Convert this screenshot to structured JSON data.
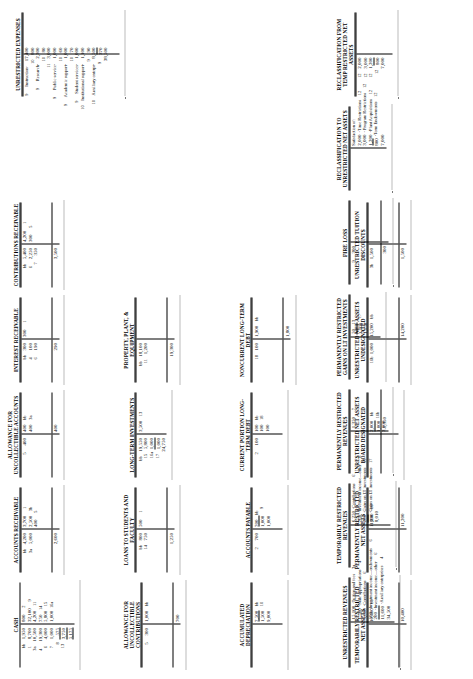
{
  "document": {
    "type": "t-account-worksheet",
    "orientation": "landscape-rotated"
  },
  "accounts": [
    {
      "id": "cash",
      "title": "CASH",
      "debits": [
        {
          "ref": "bb",
          "amount": "1,950"
        },
        {
          "ref": "1",
          "amount": "8,700"
        },
        {
          "ref": "3a",
          "amount": "10,500"
        },
        {
          "ref": "4",
          "amount": "19,300"
        },
        {
          "ref": "6",
          "amount": "4,000"
        },
        {
          "ref": "7",
          "amount": "1,000"
        },
        {
          "ref": "8",
          "amount": "575"
        },
        {
          "ref": "13",
          "amount": "3,750"
        }
      ],
      "debit_total": "5,175",
      "credits": [
        {
          "ref": "2",
          "amount": "800"
        },
        {
          "ref": "9",
          "amount": "32,100"
        },
        {
          "ref": "11",
          "amount": "4,200"
        },
        {
          "ref": "14",
          "amount": "750"
        },
        {
          "ref": "15",
          "amount": "5,800"
        },
        {
          "ref": "16a",
          "amount": "1,000"
        }
      ],
      "credit_total": ""
    },
    {
      "id": "accounts-receivable",
      "title": "ACCOUNTS RECEIVABLE",
      "debits": [
        {
          "ref": "bb",
          "amount": "4,200"
        },
        {
          "ref": "3a",
          "amount": "5,000"
        }
      ],
      "debit_total": "2,600",
      "credits": [
        {
          "ref": "1",
          "amount": "3,700"
        },
        {
          "ref": "3b",
          "amount": "2,500"
        },
        {
          "ref": "5",
          "amount": "400"
        }
      ],
      "credit_total": ""
    },
    {
      "id": "allowance-uncollectible-accounts",
      "title": "ALLOWANCE FOR UNCOLLECTIBLE ACCOUNTS",
      "debits": [
        {
          "ref": "5",
          "amount": "400"
        }
      ],
      "debit_total": "",
      "credits": [
        {
          "ref": "bb",
          "amount": "400"
        },
        {
          "ref": "3a",
          "amount": "400"
        }
      ],
      "credit_total": "400"
    },
    {
      "id": "interest-receivable",
      "title": "INTEREST RECEIVABLE",
      "debits": [
        {
          "ref": "bb",
          "amount": "300"
        },
        {
          "ref": "4",
          "amount": "100"
        },
        {
          "ref": "6",
          "amount": "190"
        }
      ],
      "debit_total": "290",
      "credits": [
        {
          "ref": "1",
          "amount": "300"
        }
      ],
      "credit_total": ""
    },
    {
      "id": "contributions-receivable",
      "title": "CONTRIBUTIONS RECEIVABLE",
      "debits": [
        {
          "ref": "bb",
          "amount": "5,400"
        },
        {
          "ref": "6",
          "amount": "2,250"
        },
        {
          "ref": "7",
          "amount": "350"
        }
      ],
      "debit_total": "3,500",
      "credits": [
        {
          "ref": "1",
          "amount": "4,200"
        },
        {
          "ref": "5",
          "amount": "300"
        }
      ],
      "credit_total": ""
    },
    {
      "id": "allowance-uncollectible-contributions",
      "title": "ALLOWANCE FOR UNCOLLECTIBLE CONTRIBUTIONS",
      "debits": [
        {
          "ref": "5",
          "amount": "300"
        }
      ],
      "debit_total": "",
      "credits": [
        {
          "ref": "bb",
          "amount": "1,000"
        }
      ],
      "credit_total": "700"
    },
    {
      "id": "loans-to-students",
      "title": "LOANS TO STUDENTS AND FACULTY",
      "debits": [
        {
          "ref": "bb",
          "amount": "800"
        },
        {
          "ref": "14",
          "amount": "750"
        }
      ],
      "debit_total": "1,250",
      "credits": [
        {
          "ref": "1",
          "amount": "500"
        }
      ],
      "credit_total": ""
    },
    {
      "id": "long-term-investments",
      "title": "LONG-TERM INVESTMENTS",
      "debits": [
        {
          "ref": "bb",
          "amount": "19,550"
        },
        {
          "ref": "15",
          "amount": "5,800"
        },
        {
          "ref": "16a",
          "amount": "1,000"
        },
        {
          "ref": "17",
          "amount": "1,000"
        }
      ],
      "debit_total": "24,750",
      "credits": [
        {
          "ref": "13",
          "amount": "3,500"
        }
      ],
      "credit_total": ""
    },
    {
      "id": "property-plant-equipment",
      "title": "PROPERTY, PLANT, & EQUIPMENT",
      "debits": [
        {
          "ref": "bb",
          "amount": "18,100"
        },
        {
          "ref": "11",
          "amount": "1,200"
        }
      ],
      "debit_total": "19,300",
      "credits": [],
      "credit_total": ""
    },
    {
      "id": "accumulated-depreciation",
      "title": "ACCUMULATED DEPRECIATION",
      "debits": [],
      "debit_total": "",
      "credits": [
        {
          "ref": "bb",
          "amount": "7,500"
        },
        {
          "ref": "10",
          "amount": "1,500"
        }
      ],
      "credit_total": "9,000"
    },
    {
      "id": "accounts-payable",
      "title": "ACCOUNTS PAYABLE",
      "debits": [
        {
          "ref": "2",
          "amount": "700"
        }
      ],
      "debit_total": "",
      "credits": [
        {
          "ref": "bb",
          "amount": "700"
        },
        {
          "ref": "9",
          "amount": "1,000"
        }
      ],
      "credit_total": "1,000"
    },
    {
      "id": "current-portion-long-term-debt",
      "title": "CURRENT PORTION LONG-TERM DEBT",
      "debits": [
        {
          "ref": "2",
          "amount": "100"
        }
      ],
      "debit_total": "",
      "credits": [
        {
          "ref": "bb",
          "amount": "100"
        },
        {
          "ref": "18",
          "amount": "100"
        },
        {
          "ref": "",
          "amount": "100"
        }
      ],
      "credit_total": ""
    },
    {
      "id": "noncurrent-long-term-debt",
      "title": "NONCURRENT LONG-TERM DEBT",
      "debits": [
        {
          "ref": "18",
          "amount": "100"
        }
      ],
      "debit_total": "",
      "credits": [
        {
          "ref": "bb",
          "amount": "1,900"
        }
      ],
      "credit_total": "1,800"
    },
    {
      "id": "temporarily-restricted-net-assets",
      "title": "TEMPORARILY RESTRICTED NET ASSETS",
      "debits": [],
      "debit_total": "",
      "credits": [
        {
          "ref": "bb",
          "amount": "10,400"
        }
      ],
      "credit_total": "10,400"
    },
    {
      "id": "permanently-restricted-net-assets",
      "title": "PERMANENTLY RESTRICTED NET ASSETS",
      "debits": [],
      "debit_total": "",
      "credits": [
        {
          "ref": "bb",
          "amount": "11,200"
        }
      ],
      "credit_total": "11,200"
    },
    {
      "id": "unrestricted-net-assets-board-designated",
      "title": "UNRESTRICTED NET ASSETS BOARD DESIGNATED",
      "debits": [],
      "debit_total": "",
      "credits": [
        {
          "ref": "bb",
          "amount": "2,000"
        },
        {
          "ref": "16b",
          "amount": "1,000"
        }
      ],
      "credit_total": "3,000"
    },
    {
      "id": "unrestricted-net-assets-undesignated",
      "title": "UNRESTRICTED NET ASSETS UNDESIGNATED",
      "debits": [
        {
          "ref": "16b",
          "amount": "1,000"
        }
      ],
      "debit_total": "",
      "credits": [
        {
          "ref": "bb",
          "amount": "15,200"
        }
      ],
      "credit_total": "14,200"
    },
    {
      "id": "unrestricted-tuition-discounts",
      "title": "UNRESTRICTED TUITION DISCOUNTS",
      "debits": [
        {
          "ref": "3b",
          "amount": "1,500"
        }
      ],
      "debit_total": "1,500",
      "credits": [],
      "credit_total": ""
    },
    {
      "id": "unrestricted-revenues",
      "title": "UNRESTRICTED REVENUES",
      "debits": [],
      "debit_total": "",
      "credits": [
        {
          "ref": "3a",
          "amount": "15,100"
        },
        {
          "ref": "4",
          "amount": "1,500"
        },
        {
          "ref": "6",
          "amount": "5,600"
        },
        {
          "ref": "6",
          "amount": "500"
        },
        {
          "ref": "6",
          "amount": "200"
        },
        {
          "ref": "4",
          "amount": "11,600"
        }
      ],
      "credit_total": "34,500",
      "legend": [
        "-Tuition and fees",
        "-State appropriations",
        "-Contributions",
        "-Investment income—endowments",
        "-Investment income—other",
        "-Auxiliary enterprises"
      ]
    },
    {
      "id": "temporarily-restricted-revenues",
      "title": "TEMPORARILY RESTRICTED REVENUES",
      "debits": [],
      "debit_total": "",
      "credits": [
        {
          "ref": "6",
          "amount": "6,250"
        },
        {
          "ref": "8",
          "amount": "760"
        },
        {
          "ref": "13",
          "amount": "200"
        },
        {
          "ref": "17",
          "amount": "800"
        }
      ],
      "credit_total": "8,010",
      "legend": [
        "-Contributions",
        "-Investment income—other",
        "-Gains on LT investments",
        "-Gains on LT investments"
      ]
    },
    {
      "id": "permanently-restricted-revenues",
      "title": "PERMANENTLY RESTRICTED REVENUES",
      "debits": [],
      "debit_total": "",
      "credits": [
        {
          "ref": "7",
          "amount": "1,350"
        }
      ],
      "credit_total": "1,350"
    },
    {
      "id": "permanently-restricted-gains",
      "title": "PERMANENTLY RESTRICTED GAINS ON LT INVESTMENTS",
      "debits": [],
      "debit_total": "",
      "credits": [
        {
          "ref": "13",
          "amount": "50"
        },
        {
          "ref": "17",
          "amount": "1,100"
        }
      ],
      "credit_total": "1,150"
    },
    {
      "id": "fire-loss",
      "title": "FIRE LOSS",
      "debits": [
        {
          "ref": "9",
          "amount": "300"
        }
      ],
      "debit_total": "300",
      "credits": [],
      "credit_total": ""
    },
    {
      "id": "reclassification-to-unrestricted-net-assets",
      "title": "RECLASSIFICATION TO UNRESTRICTED NET ASSETS",
      "debits": [],
      "debit_total": "",
      "credits": [
        {
          "ref": "12",
          "amount": "2,000"
        },
        {
          "ref": "12",
          "amount": "3,000"
        },
        {
          "ref": "12",
          "amount": "1,200"
        },
        {
          "ref": "12",
          "amount": "800"
        }
      ],
      "credit_total": "7,000",
      "legend": [
        "Satisfaction of:",
        "-Time Restrictions",
        "- Program Restrictions",
        "-Plant Acquisitions",
        "-Term Endowments"
      ]
    },
    {
      "id": "reclassification-from-temp-restricted-net-assets",
      "title": "RECLASSIFICATION FROM TEMP RESTRICTED NET ASSETS",
      "debits": [
        {
          "ref": "12",
          "amount": "2,000"
        },
        {
          "ref": "12",
          "amount": "3,000"
        },
        {
          "ref": "12",
          "amount": "1,200"
        },
        {
          "ref": "12",
          "amount": "800"
        }
      ],
      "debit_total": "7,000",
      "credits": [],
      "credit_total": ""
    },
    {
      "id": "unrestricted-expenses",
      "title": "UNRESTRICTED EXPENSES",
      "debits": [
        {
          "ref": "9",
          "amount": "17,400"
        },
        {
          "ref": "10",
          "amount": "800"
        },
        {
          "ref": "9",
          "amount": "2,300"
        },
        {
          "ref": "10",
          "amount": "80"
        },
        {
          "ref": "11",
          "amount": "3,000"
        },
        {
          "ref": "9",
          "amount": "1,000"
        },
        {
          "ref": "10",
          "amount": "60"
        },
        {
          "ref": "9",
          "amount": "1,000"
        },
        {
          "ref": "10",
          "amount": "70"
        },
        {
          "ref": "9",
          "amount": "1,000"
        },
        {
          "ref": "10",
          "amount": "1,100"
        },
        {
          "ref": "9",
          "amount": "90"
        },
        {
          "ref": "10",
          "amount": "8,500"
        },
        {
          "ref": "9",
          "amount": "370"
        },
        {
          "ref": "10",
          "amount": ""
        }
      ],
      "debit_total": "38,500",
      "credits": [],
      "credit_total": "",
      "expense_names": [
        "Instruction-",
        "Research-",
        "Public service-",
        "Academic support-",
        "Student services-",
        "Institutional support-",
        "Auxiliary enterpr-"
      ]
    }
  ]
}
